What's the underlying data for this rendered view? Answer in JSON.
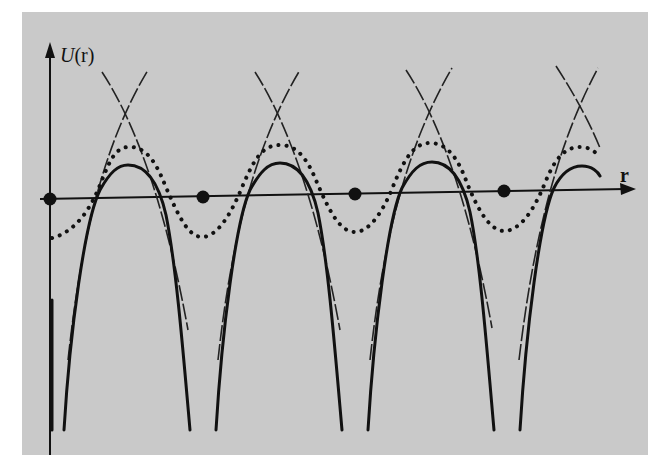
{
  "figure": {
    "y_axis_label_func": "U",
    "y_axis_label_arg": "(r)",
    "x_axis_label": "r",
    "colors": {
      "panel": "#c9c9c9",
      "ink": "#111111",
      "page": "#ffffff"
    },
    "ion_positions_px": [
      50,
      203,
      355,
      504
    ],
    "curves": [
      {
        "name": "atomic-potentials",
        "style": "dashed",
        "description": "Individual ionic potentials, crossing midway between ions"
      },
      {
        "name": "crystal-potential",
        "style": "solid",
        "description": "Total periodic potential, diverging at each ion"
      },
      {
        "name": "weak-potential",
        "style": "dotted",
        "description": "Smooth weak periodic potential oscillating about axis"
      }
    ]
  }
}
